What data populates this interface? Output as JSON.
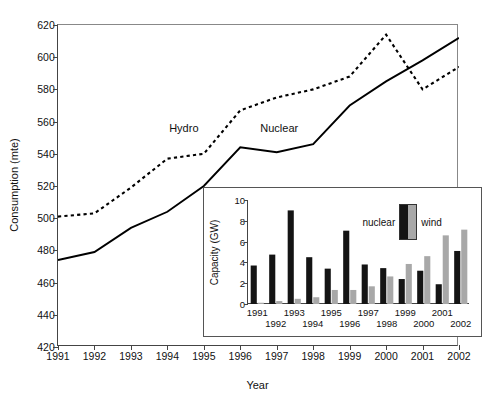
{
  "chart_data": [
    {
      "type": "line",
      "name": "main-chart",
      "title": "",
      "xlabel": "Year",
      "ylabel": "Consumption (mte)",
      "xlim": [
        1991,
        2002
      ],
      "ylim": [
        420,
        620
      ],
      "yticks": [
        420,
        440,
        460,
        480,
        500,
        520,
        540,
        560,
        580,
        600,
        620
      ],
      "xticks": [
        1991,
        1992,
        1993,
        1994,
        1995,
        1996,
        1997,
        1998,
        1999,
        2000,
        2001,
        2002
      ],
      "grid": false,
      "legend": "inline-annotations",
      "x": [
        1991,
        1992,
        1993,
        1994,
        1995,
        1996,
        1997,
        1998,
        1999,
        2000,
        2001,
        2002
      ],
      "series": [
        {
          "name": "Hydro",
          "style": "dashed",
          "color": "#000000",
          "label_position": {
            "x": 1994.05,
            "y": 556
          },
          "values": [
            501,
            503,
            519,
            537,
            540,
            567,
            575,
            580,
            588,
            614,
            580,
            594
          ]
        },
        {
          "name": "Nuclear",
          "style": "solid",
          "color": "#000000",
          "label_position": {
            "x": 1996.55,
            "y": 556
          },
          "values": [
            474,
            479,
            494,
            504,
            520,
            544,
            541,
            546,
            570,
            585,
            598,
            612
          ]
        }
      ]
    },
    {
      "type": "bar",
      "name": "inset-chart",
      "title": "",
      "xlabel": "",
      "ylabel": "Capacity (GW)",
      "ylim": [
        0,
        10
      ],
      "yticks": [
        0,
        2,
        4,
        6,
        8,
        10
      ],
      "grid": false,
      "legend_position": "upper-right-inside",
      "categories": [
        "1991",
        "1992",
        "1993",
        "1994",
        "1995",
        "1996",
        "1997",
        "1998",
        "1999",
        "2000",
        "2001",
        "2002"
      ],
      "series": [
        {
          "name": "nuclear",
          "color": "#141414",
          "values": [
            3.7,
            4.75,
            9.0,
            4.5,
            3.4,
            7.05,
            3.8,
            3.45,
            2.4,
            3.2,
            1.9,
            5.1
          ]
        },
        {
          "name": "wind",
          "color": "#a8a8a8",
          "values": [
            0.12,
            0.28,
            0.5,
            0.65,
            1.35,
            1.35,
            1.7,
            2.65,
            3.85,
            4.6,
            6.6,
            7.15
          ]
        }
      ]
    }
  ],
  "main": {
    "ylabel": "Consumption (mte)",
    "xlabel": "Year",
    "hydro_label": "Hydro",
    "nuclear_label": "Nuclear"
  },
  "inset": {
    "ylabel": "Capacity (GW)",
    "legend": {
      "nuclear_label": "nuclear",
      "wind_label": "wind"
    }
  }
}
